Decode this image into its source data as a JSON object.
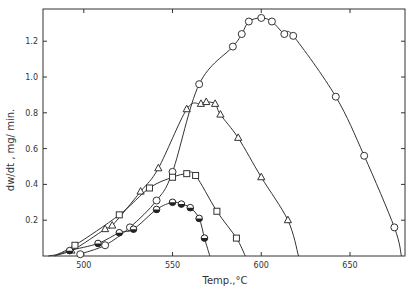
{
  "chart_data": {
    "type": "line",
    "title": "",
    "xlabel": "Temp.,°C",
    "ylabel": "dw/dt ,  mg/ min.",
    "xlim": [
      477,
      681
    ],
    "ylim": [
      0,
      1.38
    ],
    "xticks": [
      500,
      550,
      600,
      650
    ],
    "yticks": [
      0.2,
      0.4,
      0.6,
      0.8,
      1.0,
      1.2
    ],
    "grid": false,
    "legend": "none",
    "series": [
      {
        "name": "open-circle",
        "marker": "circle",
        "x": [
          498,
          512,
          526,
          541,
          550,
          565,
          584,
          589,
          593,
          600,
          606,
          613,
          618,
          642,
          658,
          675
        ],
        "values": [
          0.01,
          0.06,
          0.16,
          0.31,
          0.47,
          0.96,
          1.17,
          1.24,
          1.31,
          1.33,
          1.31,
          1.24,
          1.23,
          0.89,
          0.56,
          0.16
        ]
      },
      {
        "name": "triangle",
        "marker": "triangle",
        "x": [
          493,
          512,
          516,
          532,
          542,
          558,
          566,
          569,
          574,
          577,
          587,
          600,
          615
        ],
        "values": [
          0.03,
          0.15,
          0.17,
          0.36,
          0.49,
          0.82,
          0.85,
          0.86,
          0.85,
          0.79,
          0.66,
          0.44,
          0.2
        ]
      },
      {
        "name": "square",
        "marker": "square",
        "x": [
          495,
          520,
          537,
          550,
          558,
          563,
          575,
          586
        ],
        "values": [
          0.06,
          0.23,
          0.38,
          0.44,
          0.46,
          0.45,
          0.25,
          0.1
        ]
      },
      {
        "name": "half-filled-circle",
        "marker": "half-circle",
        "x": [
          492,
          508,
          520,
          528,
          541,
          550,
          555,
          560,
          565,
          568
        ],
        "values": [
          0.03,
          0.07,
          0.13,
          0.15,
          0.26,
          0.3,
          0.29,
          0.27,
          0.21,
          0.1
        ]
      }
    ]
  }
}
